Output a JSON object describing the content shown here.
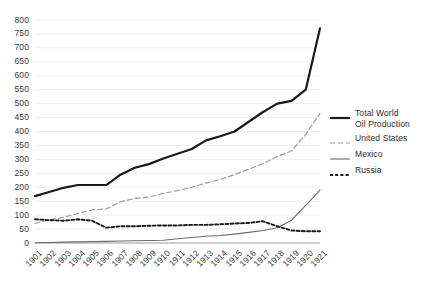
{
  "chart_data": {
    "type": "line",
    "title": "",
    "xlabel": "",
    "ylabel": "",
    "grid": true,
    "legend_position": "right",
    "ylim": [
      0,
      800
    ],
    "yticks": [
      0,
      50,
      100,
      150,
      200,
      250,
      300,
      350,
      400,
      450,
      500,
      550,
      600,
      650,
      700,
      750,
      800
    ],
    "x": [
      "1901",
      "1902",
      "1903",
      "1904",
      "1905",
      "1906",
      "1907",
      "1908",
      "1909",
      "1910",
      "1911",
      "1912",
      "1913",
      "1914",
      "1915",
      "1916",
      "1917",
      "1918",
      "1919",
      "1920",
      "1921"
    ],
    "series": [
      {
        "name": "Total World Oil Production",
        "style": "solid-thick",
        "color": "#1a1a1a",
        "values": [
          168,
          183,
          198,
          208,
          208,
          208,
          245,
          270,
          283,
          303,
          320,
          337,
          368,
          383,
          400,
          435,
          470,
          500,
          510,
          550,
          770
        ]
      },
      {
        "name": "United States",
        "style": "dashed-long",
        "color": "#999999",
        "values": [
          70,
          83,
          92,
          106,
          119,
          122,
          148,
          160,
          165,
          178,
          188,
          200,
          215,
          228,
          245,
          265,
          285,
          310,
          330,
          390,
          465
        ]
      },
      {
        "name": "Mexico",
        "style": "solid-thin",
        "color": "#6b6b6b",
        "values": [
          1,
          2,
          3,
          4,
          5,
          6,
          7,
          8,
          9,
          10,
          15,
          20,
          24,
          27,
          32,
          38,
          45,
          55,
          82,
          135,
          190
        ]
      },
      {
        "name": "Russia",
        "style": "dashed-short",
        "color": "#1a1a1a",
        "values": [
          85,
          82,
          80,
          85,
          80,
          55,
          60,
          60,
          62,
          63,
          63,
          65,
          65,
          67,
          70,
          72,
          78,
          60,
          45,
          42,
          42
        ]
      }
    ]
  },
  "legend": {
    "items": [
      {
        "label": "Total World\nOil Production"
      },
      {
        "label": "United States"
      },
      {
        "label": "Mexico"
      },
      {
        "label": "Russia"
      }
    ]
  }
}
